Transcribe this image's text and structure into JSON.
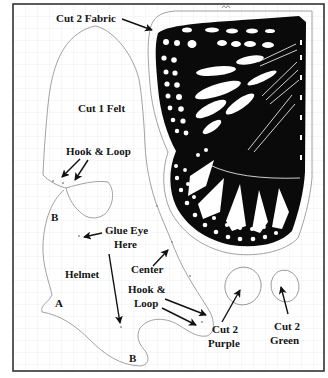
{
  "diagram": {
    "type": "sewing-pattern",
    "colors": {
      "ink": "#111111",
      "cut_line": "#8a8a8a",
      "grid": "#e8e8e8",
      "frame": "#333333",
      "background": "#ffffff"
    },
    "grid": {
      "visible": true,
      "spacing_px": 12
    }
  },
  "pieces": {
    "wing": {
      "name": "Butterfly wing (monarch)",
      "label": "Cut 2 Fabric"
    },
    "felt": {
      "label": "Cut 1 Felt"
    },
    "helmet": {
      "label": "Helmet",
      "mark_a": "A",
      "mark_b_top": "B",
      "mark_b_bottom": "B"
    },
    "purple_eye": {
      "label_line1": "Cut 2",
      "label_line2": "Purple"
    },
    "green_eye": {
      "label_line1": "Cut 2",
      "label_line2": "Green"
    }
  },
  "annotations": {
    "hook_loop_top": "Hook & Loop",
    "glue_eye_line1": "Glue Eye",
    "glue_eye_line2": "Here",
    "center": "Center",
    "hook_loop_bottom_line1": "Hook &",
    "hook_loop_bottom_line2": "Loop"
  }
}
